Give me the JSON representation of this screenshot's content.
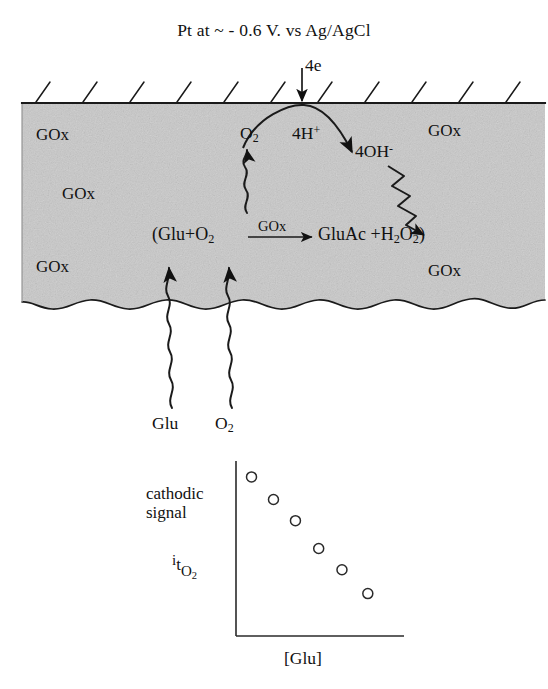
{
  "figure": {
    "title": "Pt at ~ - 0.6 V. vs Ag/AgCl",
    "background_color": "#ffffff",
    "ink_color": "#111111",
    "membrane_fill": "#c9c9c9"
  },
  "electrode": {
    "surface_hatch_count": 11,
    "electron_label": "4e",
    "proton_label_main": "4H",
    "proton_label_sup": "+",
    "hydroxide_label_main": "4OH",
    "hydroxide_label_sup": "-",
    "oxygen_label_main": "O",
    "oxygen_label_sub": "2"
  },
  "membrane": {
    "enzyme_label": "GOx",
    "enzyme_positions": [
      {
        "x": 36,
        "y": 126
      },
      {
        "x": 62,
        "y": 185
      },
      {
        "x": 36,
        "y": 258
      },
      {
        "x": 428,
        "y": 122
      },
      {
        "x": 428,
        "y": 262
      }
    ]
  },
  "reaction": {
    "open_paren": "(",
    "substrate": "Glu",
    "plus_1": "+",
    "oxygen_main": "O",
    "oxygen_sub": "2",
    "catalyst": "GOx",
    "product_1": "GluAc",
    "plus_2": "+",
    "peroxide": "H",
    "peroxide_sub_1": "2",
    "peroxide_o": "O",
    "peroxide_sub_2": "2",
    "close_paren": ")"
  },
  "influx": {
    "glucose_label": "Glu",
    "oxygen_label_main": "O",
    "oxygen_label_sub": "2"
  },
  "chart_data": {
    "type": "scatter",
    "title": "",
    "xlabel": "[Glu]",
    "ylabel": "cathodic signal",
    "ylabel_symbol_i": "i",
    "ylabel_symbol_t": "t",
    "ylabel_symbol_o": "O",
    "ylabel_symbol_o_sub": "2",
    "marker": "open-circle",
    "grid": false,
    "legend": false,
    "xlim": [
      0,
      6.5
    ],
    "ylim": [
      0,
      6.6
    ],
    "x": [
      0.6,
      1.45,
      2.3,
      3.2,
      4.1,
      5.1
    ],
    "y": [
      6.0,
      5.15,
      4.35,
      3.3,
      2.5,
      1.6
    ]
  }
}
